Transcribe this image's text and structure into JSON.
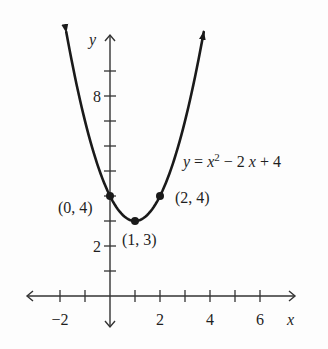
{
  "chart_data": {
    "type": "line",
    "title": "",
    "equation": {
      "lhs": "y",
      "eq": " = ",
      "base": "x",
      "exponent": "2",
      "rest": " − 2x + 4"
    },
    "function": {
      "a": 1,
      "b": -2,
      "c": 4
    },
    "domain": [
      -1.75,
      3.75
    ],
    "xlabel": "x",
    "ylabel": "y",
    "xlim": [
      -3.4,
      7.4
    ],
    "ylim": [
      -1.2,
      10.5
    ],
    "x_ticks": [
      -2,
      -1,
      1,
      2,
      3,
      4,
      5,
      6
    ],
    "x_tick_labels": [
      {
        "value": -2,
        "label": "−2"
      },
      {
        "value": 2,
        "label": "2"
      },
      {
        "value": 4,
        "label": "4"
      },
      {
        "value": 6,
        "label": "6"
      }
    ],
    "y_ticks": [
      1,
      2,
      3,
      4,
      5,
      6,
      7,
      8,
      9
    ],
    "y_tick_labels": [
      {
        "value": 2,
        "label": "2"
      },
      {
        "value": 8,
        "label": "8"
      }
    ],
    "points": [
      {
        "x": 0,
        "y": 4,
        "label": "(0, 4)"
      },
      {
        "x": 1,
        "y": 3,
        "label": "(1, 3)"
      },
      {
        "x": 2,
        "y": 4,
        "label": "(2, 4)"
      }
    ],
    "grid": false,
    "legend": null,
    "colors": {
      "curve": "#1a1a1a",
      "axes": "#333333",
      "text": "#1f1f1f"
    }
  }
}
